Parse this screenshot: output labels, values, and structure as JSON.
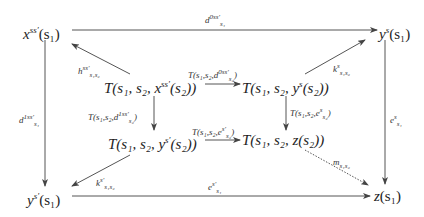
{
  "diagram": {
    "type": "commutative-diagram",
    "nodes": {
      "x_top_left": {
        "base": "x",
        "sup": "ss′",
        "arg": "(s₁)"
      },
      "y_top_right": {
        "base": "y",
        "sup": "s",
        "arg": "(s₁)"
      },
      "y_bottom_left": {
        "base": "y",
        "sup": "s′",
        "arg": "(s₁)"
      },
      "z_bottom_right": {
        "base": "z",
        "sup": "",
        "arg": "(s₁)"
      },
      "T_x": {
        "pre": "T(s₁, s₂, x",
        "sup": "ss′",
        "post": "(s₂))"
      },
      "T_y": {
        "pre": "T(s₁, s₂, y",
        "sup": "s",
        "post": "(s₂))"
      },
      "T_ys": {
        "pre": "T(s₁, s₂, y",
        "sup": "s′",
        "post": "(s₂))"
      },
      "T_z": {
        "pre": "T(s₁, s₂, z(s₂))",
        "sup": "",
        "post": ""
      }
    },
    "arrows": {
      "top": {
        "base": "d",
        "sup": "0ss′",
        "sub": "s₁",
        "style": "solid"
      },
      "left": {
        "base": "d",
        "sup": "1ss′",
        "sub": "s₁",
        "style": "solid"
      },
      "right": {
        "base": "e",
        "sup": "s",
        "sub": "s₁",
        "style": "solid"
      },
      "bottom": {
        "base": "e",
        "sup": "s′",
        "sub": "s₁",
        "style": "solid"
      },
      "h": {
        "base": "h",
        "sup": "ss′",
        "sub": "s₁s₂",
        "style": "solid"
      },
      "k_s": {
        "base": "k",
        "sup": "s",
        "sub": "s₁s₂",
        "style": "solid"
      },
      "k_sprime": {
        "base": "k",
        "sup": "s′",
        "sub": "s₁s₂",
        "style": "solid"
      },
      "m": {
        "base": "m",
        "sup": "",
        "sub": "s₁s₂",
        "style": "dotted"
      },
      "inner_top": {
        "pre": "T(s₁,s₂,d",
        "sup": "0ss′",
        "sub": "s₂",
        "post": ")"
      },
      "inner_left": {
        "pre": "T(s₁,s₂,d",
        "sup": "1ss′",
        "sub": "s₂",
        "post": ")"
      },
      "inner_right": {
        "pre": "T(s₁,s₂,e",
        "sup": "s",
        "sub": "s₂",
        "post": ")"
      },
      "inner_bottom": {
        "pre": "T(s₁,s₂,e",
        "sup": "s′",
        "sub": "s₂",
        "post": ")"
      }
    }
  }
}
